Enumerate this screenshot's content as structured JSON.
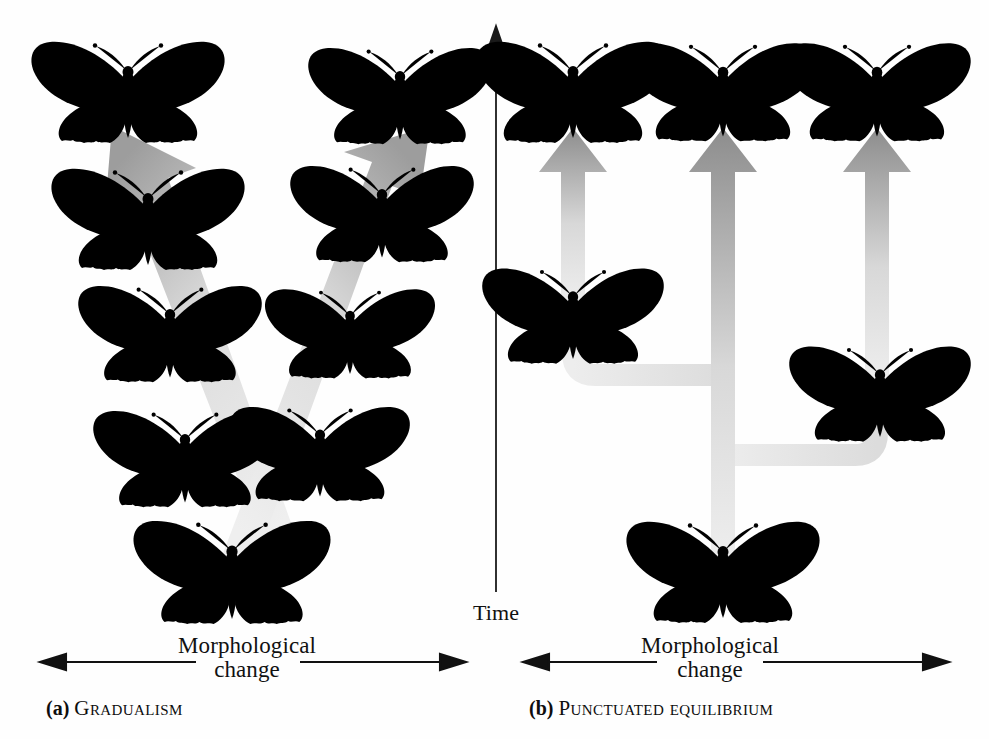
{
  "figure": {
    "background_color": "#fefefe",
    "ink_color": "#111111"
  },
  "time_axis": {
    "label": "Time",
    "direction": "upward",
    "color": "#1a1a1a"
  },
  "panels": [
    {
      "id": "a",
      "tag": "(a)",
      "name": "Gradualism",
      "axis_label": "Morphological\nchange",
      "axis_type": "double-headed-horizontal-arrow",
      "arrow_count": 2,
      "arrow_style": "broad tapered diverging arrows",
      "arrow_color_light": "#e9e9e9",
      "arrow_color_dark": "#9a9a9a",
      "butterflies": [
        {
          "id": "a-lineage1-t5",
          "lineage": 1,
          "step": 5,
          "shade": "dark",
          "x": 128,
          "y": 88,
          "scale": 1.0
        },
        {
          "id": "a-lineage1-t4",
          "lineage": 1,
          "step": 4,
          "shade": "dark",
          "x": 148,
          "y": 215,
          "scale": 1.0
        },
        {
          "id": "a-lineage1-t3",
          "lineage": 1,
          "step": 3,
          "shade": "dark-mid",
          "x": 170,
          "y": 330,
          "scale": 0.95
        },
        {
          "id": "a-lineage1-t2",
          "lineage": 1,
          "step": 2,
          "shade": "mid",
          "x": 185,
          "y": 455,
          "scale": 0.95
        },
        {
          "id": "a-lineage2-t5",
          "lineage": 2,
          "step": 5,
          "shade": "light",
          "x": 400,
          "y": 92,
          "scale": 0.95
        },
        {
          "id": "a-lineage2-t4",
          "lineage": 2,
          "step": 4,
          "shade": "mid-light",
          "x": 382,
          "y": 210,
          "scale": 0.95
        },
        {
          "id": "a-lineage2-t3",
          "lineage": 2,
          "step": 3,
          "shade": "mid",
          "x": 350,
          "y": 330,
          "scale": 0.88
        },
        {
          "id": "a-lineage2-t2",
          "lineage": 2,
          "step": 2,
          "shade": "mid",
          "x": 320,
          "y": 450,
          "scale": 0.93
        },
        {
          "id": "a-ancestor",
          "lineage": 0,
          "step": 1,
          "shade": "mid",
          "x": 232,
          "y": 568,
          "scale": 1.02
        }
      ],
      "arrows": [
        {
          "id": "a-arrow-left",
          "from_x": 250,
          "from_y": 545,
          "to_x": 126,
          "to_y": 150
        },
        {
          "id": "a-arrow-right",
          "from_x": 243,
          "from_y": 545,
          "to_x": 404,
          "to_y": 150
        }
      ]
    },
    {
      "id": "b",
      "tag": "(b)",
      "name": "Punctuated equilibrium",
      "axis_label": "Morphological\nchange",
      "axis_type": "double-headed-horizontal-arrow",
      "arrow_count": 3,
      "arrow_style": "thick vertical arrows on a cladogram trunk",
      "arrow_color_light": "#e4e4e4",
      "arrow_color_dark": "#8e8e8e",
      "branch_color": "#e6e6e6",
      "butterflies": [
        {
          "id": "b-tip-left",
          "position": "top-left",
          "shade": "dark",
          "x": 78,
          "y": 88,
          "scale": 1.0
        },
        {
          "id": "b-tip-mid",
          "position": "top-middle",
          "shade": "dark-mid",
          "x": 228,
          "y": 88,
          "scale": 0.97
        },
        {
          "id": "b-tip-right",
          "position": "top-right",
          "shade": "light",
          "x": 382,
          "y": 88,
          "scale": 0.97
        },
        {
          "id": "b-node-left",
          "position": "left-branch",
          "shade": "dark",
          "x": 78,
          "y": 312,
          "scale": 0.94
        },
        {
          "id": "b-node-right",
          "position": "right-branch",
          "shade": "light",
          "x": 385,
          "y": 390,
          "scale": 0.94
        },
        {
          "id": "b-ancestor",
          "position": "root",
          "shade": "mid",
          "x": 228,
          "y": 568,
          "scale": 1.0
        }
      ],
      "arrows": [
        {
          "id": "b-arrow-left",
          "x": 78,
          "bottom_y": 300,
          "top_y": 128
        },
        {
          "id": "b-arrow-mid",
          "x": 228,
          "bottom_y": 560,
          "top_y": 128
        },
        {
          "id": "b-arrow-right",
          "x": 382,
          "bottom_y": 380,
          "top_y": 128
        }
      ]
    }
  ]
}
